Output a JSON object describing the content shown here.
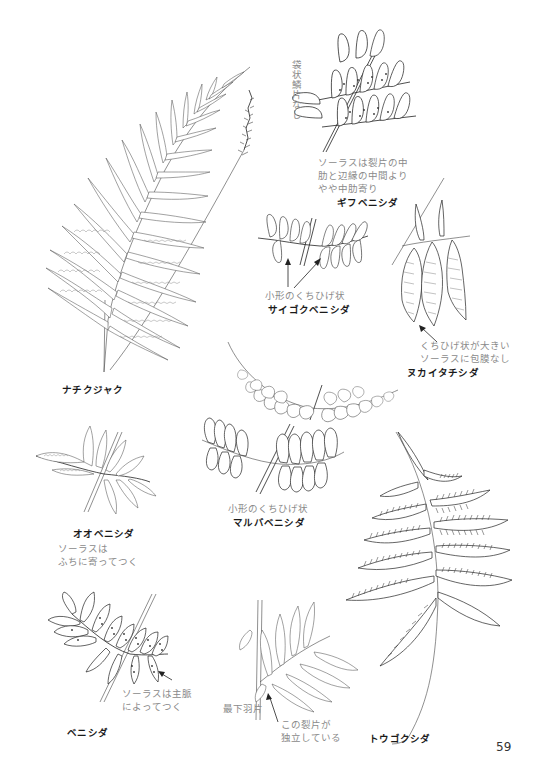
{
  "page": {
    "number": "59"
  },
  "specimens": [
    {
      "id": "nachikujaku",
      "name": "ナチクジャク",
      "notes": []
    },
    {
      "id": "gifubenishida",
      "name": "ギフベニシダ",
      "notes": [
        "ソーラスは裂片の中",
        "肋と辺縁の中間より",
        "やや中肋寄り"
      ],
      "vertical_note": "袋状鱗片なし"
    },
    {
      "id": "saigokubenishida",
      "name": "サイゴクベニシダ",
      "notes": [
        "小形のくちひげ状"
      ]
    },
    {
      "id": "nukaitachishida",
      "name": "ヌカイタチシダ",
      "notes": [
        "くちひげ状が大きい",
        "ソーラスに包膜なし"
      ]
    },
    {
      "id": "ooobenishida",
      "name": "オオベニシダ",
      "notes": [
        "ソーラスは",
        "ふちに寄ってつく"
      ]
    },
    {
      "id": "marubabenishida",
      "name": "マルバベニシダ",
      "notes": [
        "小形のくちひげ状"
      ]
    },
    {
      "id": "tougokushida",
      "name": "トウゴクシダ",
      "notes": []
    },
    {
      "id": "benishida",
      "name": "ベニシダ",
      "notes": [
        "ソーラスは主脈",
        "によってつく"
      ]
    },
    {
      "id": "unnamed-pinna",
      "name": "",
      "notes": [
        "この裂片が",
        "独立している"
      ],
      "side_label": "最下羽片"
    }
  ]
}
